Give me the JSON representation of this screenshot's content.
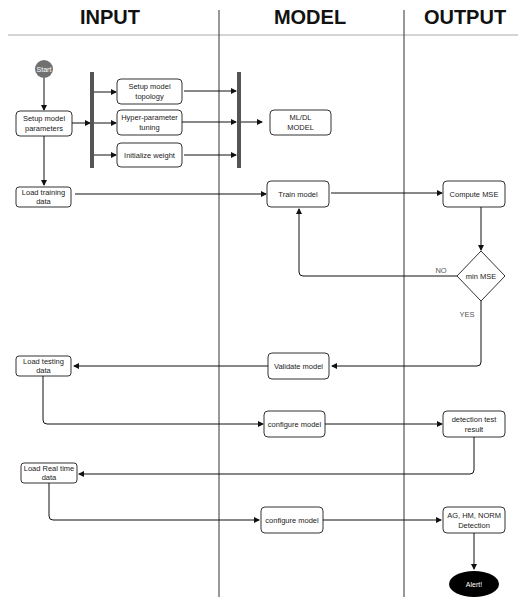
{
  "lanes": [
    {
      "title": "INPUT"
    },
    {
      "title": "MODEL"
    },
    {
      "title": "OUTPUT"
    }
  ],
  "start": {
    "label": "Start",
    "color": "#707070"
  },
  "end": {
    "label": "Alert!",
    "color": "#000000"
  },
  "nodes": {
    "setup_params": [
      "Setup model",
      "parameters"
    ],
    "setup_topology": [
      "Setup model",
      "topology"
    ],
    "hyper_tuning": [
      "Hyper-parameter",
      "tuning"
    ],
    "init_weight": [
      "Initialize weight"
    ],
    "ml_dl_model": [
      "ML/DL",
      "MODEL"
    ],
    "load_training": [
      "Load training",
      "data"
    ],
    "train_model": [
      "Train model"
    ],
    "compute_mse": [
      "Compute MSE"
    ],
    "min_mse": [
      "min MSE"
    ],
    "validate_model": [
      "Validate model"
    ],
    "load_testing": [
      "Load testing",
      "data"
    ],
    "configure_model_1": [
      "configure model"
    ],
    "detection_test": [
      "detection test",
      "result"
    ],
    "load_realtime": [
      "Load Real time",
      "data"
    ],
    "configure_model_2": [
      "configure model"
    ],
    "ag_hm_norm": [
      "AG, HM, NORM",
      "Detection"
    ]
  },
  "edge_labels": {
    "no": "NO",
    "yes": "YES"
  }
}
